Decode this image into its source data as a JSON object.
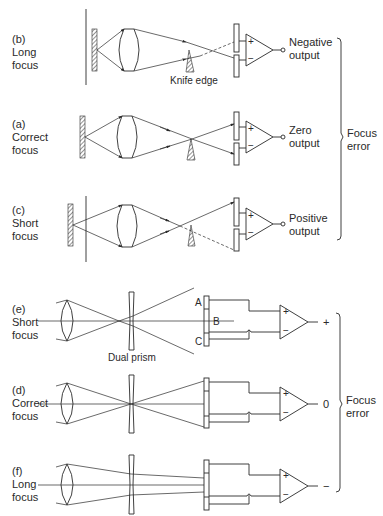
{
  "top_section": {
    "panels": [
      {
        "id": "b",
        "tag": "(b)",
        "line1": "Long",
        "line2": "focus",
        "output1": "Negative",
        "output2": "output",
        "knife_label": "Knife edge"
      },
      {
        "id": "a",
        "tag": "(a)",
        "line1": "Correct",
        "line2": "focus",
        "output1": "Zero",
        "output2": "output"
      },
      {
        "id": "c",
        "tag": "(c)",
        "line1": "Short",
        "line2": "focus",
        "output1": "Positive",
        "output2": "output"
      }
    ],
    "amp_plus": "+",
    "amp_minus": "−",
    "bracket_label1": "Focus",
    "bracket_label2": "error"
  },
  "bottom_section": {
    "panels": [
      {
        "id": "e",
        "tag": "(e)",
        "line1": "Short",
        "line2": "focus",
        "output": "+"
      },
      {
        "id": "d",
        "tag": "(d)",
        "line1": "Correct",
        "line2": "focus",
        "output": "0"
      },
      {
        "id": "f",
        "tag": "(f)",
        "line1": "Long",
        "line2": "focus",
        "output": "−"
      }
    ],
    "prism_label": "Dual prism",
    "detector_labels": {
      "a": "A",
      "b": "B",
      "c": "C"
    },
    "amp_plus": "+",
    "amp_minus": "−",
    "bracket_label1": "Focus",
    "bracket_label2": "error"
  }
}
